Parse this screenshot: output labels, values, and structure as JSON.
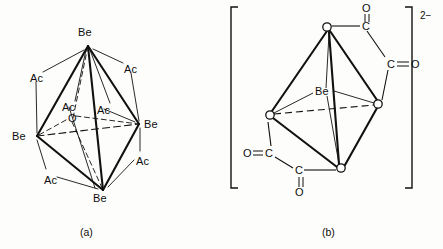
{
  "figure": {
    "colors": {
      "ink": "#111111",
      "background": "#fdfdfb",
      "vertex_fill": "#ffffff"
    },
    "panels": [
      {
        "id": "a",
        "caption": "(a)",
        "caption_pos": {
          "x": 80,
          "y": 226
        },
        "description": "Be4O(O2CCH3)6 basic acetate: central O, four Be at tetrahedron vertices, six acetate (Ac) bridges",
        "central_label": {
          "text": "O",
          "x": 68,
          "y": 113
        },
        "metal_label": "Be",
        "ligand_label": "Ac",
        "metal_atoms": [
          {
            "label": "Be",
            "vx": 88,
            "vy": 46,
            "lx": 78,
            "ly": 27
          },
          {
            "label": "Be",
            "vx": 37,
            "vy": 136,
            "lx": 12,
            "ly": 131
          },
          {
            "label": "Be",
            "vx": 139,
            "vy": 124,
            "lx": 144,
            "ly": 119
          },
          {
            "label": "Be",
            "vx": 103,
            "vy": 190,
            "lx": 93,
            "ly": 193
          }
        ],
        "ligand_atoms": [
          {
            "label": "Ac",
            "x": 30,
            "y": 73
          },
          {
            "label": "Ac",
            "x": 124,
            "y": 64
          },
          {
            "label": "Ac",
            "x": 62,
            "y": 102
          },
          {
            "label": "Ac",
            "x": 97,
            "y": 105
          },
          {
            "label": "Ac",
            "x": 136,
            "y": 156
          },
          {
            "label": "Ac",
            "x": 44,
            "y": 175
          }
        ]
      },
      {
        "id": "b",
        "caption": "(b)",
        "caption_pos": {
          "x": 322,
          "y": 226
        },
        "description": "Bracketed dianion with Be centre, four open-circle oxygen vertices and oxalate carbonyl groups",
        "charge": "2−",
        "charge_pos": {
          "x": 420,
          "y": 16
        },
        "central_label": {
          "text": "Be",
          "x": 315,
          "y": 86
        },
        "bracket": {
          "left_x": 231,
          "right_x": 412,
          "top_y": 7,
          "bottom_y": 188
        },
        "vertices": [
          {
            "x": 327,
            "y": 27
          },
          {
            "x": 270,
            "y": 115
          },
          {
            "x": 378,
            "y": 104
          },
          {
            "x": 341,
            "y": 168
          }
        ],
        "carbon_labels": [
          {
            "text": "C",
            "x": 364,
            "y": 27
          },
          {
            "text": "C",
            "x": 389,
            "y": 64
          },
          {
            "text": "C",
            "x": 267,
            "y": 153
          },
          {
            "text": "C",
            "x": 297,
            "y": 172
          }
        ],
        "oxygen_labels": [
          {
            "text": "O",
            "x": 364,
            "y": 7
          },
          {
            "text": "O",
            "x": 414,
            "y": 64
          },
          {
            "text": "O",
            "x": 245,
            "y": 153
          },
          {
            "text": "O",
            "x": 297,
            "y": 193
          }
        ]
      }
    ]
  }
}
